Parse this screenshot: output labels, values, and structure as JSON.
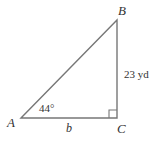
{
  "diagram": {
    "type": "right-triangle",
    "vertices": {
      "A": {
        "label": "A",
        "x": 21,
        "y": 118
      },
      "B": {
        "label": "B",
        "x": 117,
        "y": 20
      },
      "C": {
        "label": "C",
        "x": 117,
        "y": 118
      }
    },
    "angle_A_label": "44°",
    "side_BC_label": "23 yd",
    "side_AC_label": "b",
    "right_angle_at": "C",
    "colors": {
      "line": "#777777",
      "text": "#333333",
      "background": "#ffffff"
    }
  }
}
